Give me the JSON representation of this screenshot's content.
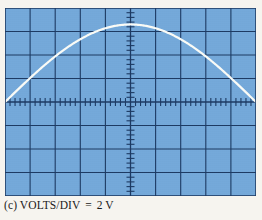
{
  "figure": {
    "label": "oscilloscope-display-figure",
    "background_color": "#f6f4ef"
  },
  "caption": {
    "part_label": "(c)",
    "setting_name": "VOLTS/DIV",
    "equals": "=",
    "setting_value": "2 V",
    "full_text": "(c) VOLTS/DIV  =  2 V"
  },
  "screen": {
    "name": "oscilloscope-graticule",
    "screen_color": "#74a9da",
    "grid_color": "#1d3a63",
    "trace_color": "#fbfcf7",
    "divisions_x": 10,
    "divisions_y": 8,
    "minor_ticks_per_division": 5,
    "volts_per_div": "2 V",
    "trace_description": "single positive half-cycle sine, peak 3.3 divisions above center axis"
  },
  "chart_data": {
    "type": "line",
    "title": "(c) VOLTS/DIV  =  2 V",
    "xlabel": "",
    "ylabel": "",
    "xlim": [
      -5,
      5
    ],
    "ylim": [
      -4,
      4
    ],
    "grid": true,
    "legend": "none",
    "x_major_ticks": [
      -5,
      -4,
      -3,
      -2,
      -1,
      0,
      1,
      2,
      3,
      4,
      5
    ],
    "y_major_ticks": [
      -4,
      -3,
      -2,
      -1,
      0,
      1,
      2,
      3,
      4
    ],
    "minor_ticks_per_division": 5,
    "volts_per_division": 2,
    "peak_amplitude_divisions": 3.3,
    "peak_amplitude_volts": 6.6,
    "series": [
      {
        "name": "trace",
        "color": "#fbfcf7",
        "x": [
          -5.0,
          -4.5,
          -4.0,
          -3.5,
          -3.0,
          -2.5,
          -2.0,
          -1.5,
          -1.0,
          -0.5,
          0.0,
          0.5,
          1.0,
          1.5,
          2.0,
          2.5,
          3.0,
          3.5,
          4.0,
          4.5,
          5.0
        ],
        "y": [
          0.0,
          0.516,
          1.019,
          1.496,
          1.94,
          2.34,
          2.689,
          2.979,
          3.205,
          3.34,
          3.3,
          3.34,
          3.205,
          2.979,
          2.689,
          2.34,
          1.94,
          1.496,
          1.019,
          0.516,
          0.0
        ]
      }
    ]
  }
}
